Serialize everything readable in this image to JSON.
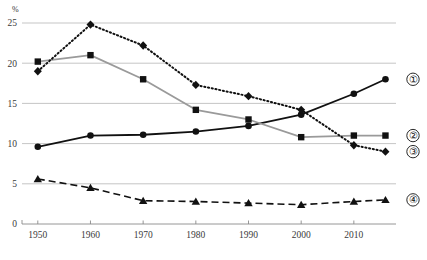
{
  "chart_data": {
    "type": "line",
    "title": "",
    "subtitle": "",
    "xlabel": "",
    "ylabel": "",
    "unit_label": "%",
    "xlim": [
      1947,
      2018
    ],
    "ylim": [
      0,
      25
    ],
    "yticks": [
      0,
      5,
      10,
      15,
      20,
      25
    ],
    "ytick_labels": [
      "0",
      "5",
      "10",
      "15",
      "20",
      "25"
    ],
    "xticks": [
      1950,
      1960,
      1970,
      1980,
      1990,
      2000,
      2010
    ],
    "xtick_labels": [
      "1950",
      "1960",
      "1970",
      "1980",
      "1990",
      "2000",
      "2010"
    ],
    "grid": true,
    "legend_position": "right-inline",
    "x": [
      1950,
      1960,
      1970,
      1980,
      1990,
      2000,
      2010,
      2016
    ],
    "series": [
      {
        "name": "1",
        "legend_label": "①",
        "marker": "circle",
        "line_style": "solid",
        "color": "#111111",
        "values": [
          9.6,
          11.0,
          11.1,
          11.5,
          12.2,
          13.6,
          16.2,
          18.0
        ]
      },
      {
        "name": "2",
        "legend_label": "②",
        "marker": "square",
        "line_style": "solid",
        "color": "#9a9a9a",
        "values": [
          20.2,
          21.0,
          18.0,
          14.2,
          13.0,
          10.8,
          11.0,
          11.0
        ]
      },
      {
        "name": "3",
        "legend_label": "③",
        "marker": "diamond",
        "line_style": "dotted",
        "color": "#111111",
        "values": [
          19.0,
          24.8,
          22.2,
          17.3,
          15.9,
          14.2,
          9.8,
          9.0
        ]
      },
      {
        "name": "4",
        "legend_label": "④",
        "marker": "triangle",
        "line_style": "dashed",
        "color": "#111111",
        "values": [
          5.6,
          4.5,
          2.9,
          2.8,
          2.6,
          2.4,
          2.8,
          3.0
        ]
      }
    ]
  },
  "footnote": {
    "text": ""
  }
}
